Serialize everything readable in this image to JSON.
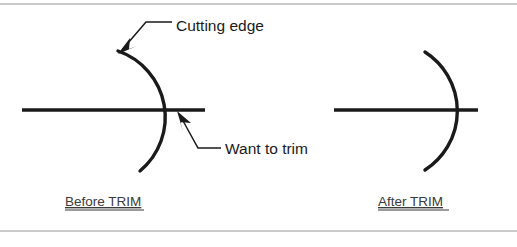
{
  "figure": {
    "colors": {
      "geometry_stroke": "#1a1a1a",
      "frame_stroke": "#b8b8b8",
      "caption_text": "#3a3a3a",
      "background": "#ffffff"
    },
    "annotations": [
      {
        "id": "cutting-edge",
        "label": "Cutting edge",
        "text_x": 176,
        "text_y": 26,
        "points_to": "arc-top-end"
      },
      {
        "id": "want-to-trim",
        "label": "Want to trim",
        "text_x": 225,
        "text_y": 153,
        "points_to": "line-arc-intersection"
      }
    ],
    "captions": [
      {
        "id": "before-trim",
        "label": "Before TRIM",
        "x": 65,
        "y": 206,
        "width": 79
      },
      {
        "id": "after-trim",
        "label": "After TRIM",
        "x": 378,
        "y": 206,
        "width": 71
      }
    ],
    "panels": [
      {
        "id": "before",
        "caption_ref": "before-trim",
        "arc": {
          "start_x": 118,
          "start_y": 51,
          "end_x": 140,
          "end_y": 171,
          "radius": 70,
          "bulge_x": 172
        },
        "line": {
          "x1": 22,
          "y1": 110,
          "x2": 205,
          "y2": 110,
          "crosses_arc": true,
          "overshoot_px": 33
        }
      },
      {
        "id": "after",
        "caption_ref": "after-trim",
        "arc": {
          "start_x": 425,
          "start_y": 52,
          "end_x": 425,
          "end_y": 170,
          "radius": 70,
          "bulge_x": 479
        },
        "line": {
          "x1": 334,
          "y1": 110,
          "x2": 478,
          "y2": 110,
          "crosses_arc": false,
          "overshoot_px": 0
        }
      }
    ],
    "frame": {
      "top_y": 4,
      "bottom_y": 231,
      "left_x": 0,
      "right_x": 517
    }
  }
}
